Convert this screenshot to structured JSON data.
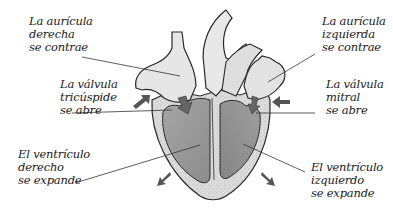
{
  "diagram": {
    "labels": {
      "right_atrium": {
        "lines": [
          "La aurícula",
          "derecha",
          "se contrae"
        ]
      },
      "left_atrium": {
        "lines": [
          "La aurícula",
          "izquierda",
          "se contrae"
        ]
      },
      "tricuspid_valve": {
        "lines": [
          "La válvula",
          "tricúspide",
          "se abre"
        ]
      },
      "mitral_valve": {
        "lines": [
          "La válvula",
          "mitral",
          "se abre"
        ]
      },
      "right_ventricle": {
        "lines": [
          "El ventrículo",
          "derecho",
          "se expande"
        ]
      },
      "left_ventricle": {
        "lines": [
          "El ventrículo",
          "izquierdo",
          "se expande"
        ]
      }
    },
    "colors": {
      "outline": "#2a2a2a",
      "wall": "#d8d8d8",
      "chamber_ventricle": "#9a9a9a",
      "chamber_atrium": "#e4e4e4",
      "arrow": "#555555",
      "leader_line": "#333333"
    }
  }
}
